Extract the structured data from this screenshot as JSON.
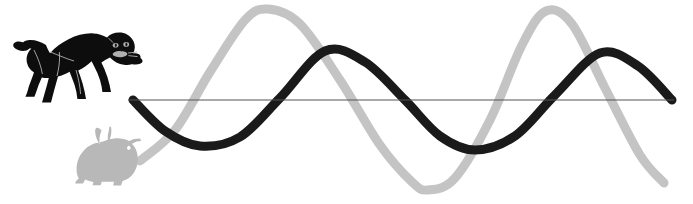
{
  "figure": {
    "width": 693,
    "height": 204,
    "background_color": "#ffffff"
  },
  "colors": {
    "dark_wave": "#1a1a1a",
    "light_wave": "#c4c4c4",
    "baseline": "#555555",
    "cat": "#0d0d0d",
    "cat_detail": "#b0b0b0",
    "rabbit": "#b8b8b8"
  },
  "elements": {
    "cat": {
      "name": "cat-silhouette",
      "pose": "crouching pounce",
      "color": "#0d0d0d",
      "bbox": [
        22,
        30,
        120,
        78
      ]
    },
    "rabbit": {
      "name": "rabbit-silhouette",
      "pose": "sitting",
      "color": "#b8b8b8",
      "bbox": [
        74,
        128,
        72,
        58
      ]
    },
    "baseline": {
      "name": "axis-baseline",
      "color": "#555555",
      "y": 100,
      "x_start": 128,
      "x_end": 674,
      "stroke_width": 1.2
    }
  },
  "chart_data": {
    "type": "line",
    "title": "",
    "xlabel": "",
    "ylabel": "",
    "grid": false,
    "legend_position": "none",
    "xlim": [
      128,
      674
    ],
    "ylim": [
      0,
      204
    ],
    "baseline_y": 100,
    "series": [
      {
        "name": "dark-wave",
        "color": "#1a1a1a",
        "stroke_width": 9,
        "phase_label": "leading",
        "points": [
          {
            "x": 133,
            "y": 100
          },
          {
            "x": 165,
            "y": 131
          },
          {
            "x": 200,
            "y": 146
          },
          {
            "x": 240,
            "y": 137
          },
          {
            "x": 280,
            "y": 98
          },
          {
            "x": 325,
            "y": 51
          },
          {
            "x": 365,
            "y": 62
          },
          {
            "x": 405,
            "y": 100
          },
          {
            "x": 440,
            "y": 136
          },
          {
            "x": 475,
            "y": 150
          },
          {
            "x": 515,
            "y": 136
          },
          {
            "x": 555,
            "y": 95
          },
          {
            "x": 600,
            "y": 53
          },
          {
            "x": 638,
            "y": 66
          },
          {
            "x": 672,
            "y": 100
          }
        ]
      },
      {
        "name": "light-wave",
        "color": "#c4c4c4",
        "stroke_width": 9,
        "phase_label": "lagging",
        "points": [
          {
            "x": 140,
            "y": 161
          },
          {
            "x": 175,
            "y": 130
          },
          {
            "x": 210,
            "y": 72
          },
          {
            "x": 245,
            "y": 20
          },
          {
            "x": 268,
            "y": 9
          },
          {
            "x": 300,
            "y": 24
          },
          {
            "x": 340,
            "y": 80
          },
          {
            "x": 380,
            "y": 145
          },
          {
            "x": 412,
            "y": 182
          },
          {
            "x": 428,
            "y": 190
          },
          {
            "x": 455,
            "y": 178
          },
          {
            "x": 490,
            "y": 120
          },
          {
            "x": 522,
            "y": 45
          },
          {
            "x": 546,
            "y": 11
          },
          {
            "x": 572,
            "y": 24
          },
          {
            "x": 605,
            "y": 88
          },
          {
            "x": 640,
            "y": 155
          },
          {
            "x": 664,
            "y": 183
          }
        ]
      }
    ]
  }
}
